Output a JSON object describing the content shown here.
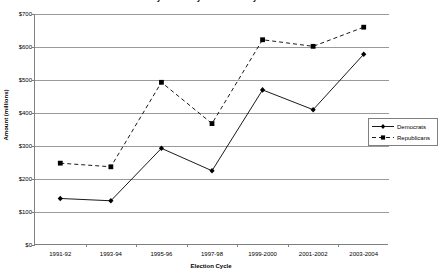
{
  "chart_data": {
    "type": "line",
    "title": "Money Raised by National Party Committees",
    "xlabel": "Election Cycle",
    "ylabel": "Amount (millions)",
    "categories": [
      "1991-92",
      "1993-94",
      "1995-96",
      "1997-98",
      "1999-2000",
      "2001-2002",
      "2003-2004"
    ],
    "ylim": [
      0,
      700
    ],
    "yticks": [
      "$0",
      "$100",
      "$200",
      "$300",
      "$400",
      "$500",
      "$600",
      "$700"
    ],
    "ytick_values": [
      0,
      100,
      200,
      300,
      400,
      500,
      600,
      700
    ],
    "grid": true,
    "legend_position": "right",
    "series": [
      {
        "name": "Democrats",
        "values": [
          141,
          134,
          293,
          225,
          470,
          410,
          578
        ],
        "line_style": "solid",
        "marker": "diamond",
        "color": "#000000"
      },
      {
        "name": "Republicans",
        "values": [
          248,
          237,
          493,
          368,
          622,
          602,
          660
        ],
        "line_style": "dashed",
        "marker": "square",
        "color": "#000000"
      }
    ]
  },
  "legend": {
    "items": [
      {
        "label": "Democrats"
      },
      {
        "label": "Republicans"
      }
    ]
  }
}
